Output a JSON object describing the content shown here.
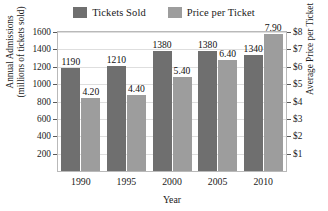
{
  "chart_data": {
    "type": "bar",
    "title": "",
    "xlabel": "Year",
    "categories": [
      "1990",
      "1995",
      "2000",
      "2005",
      "2010"
    ],
    "series": [
      {
        "name": "Tickets Sold",
        "axis": "left",
        "color": "#6f6f6f",
        "values": [
          1190,
          1210,
          1380,
          1380,
          1340
        ],
        "labels": [
          "1190",
          "1210",
          "1380",
          "1380",
          "1340"
        ]
      },
      {
        "name": "Price per Ticket",
        "axis": "right",
        "color": "#9d9d9d",
        "values": [
          4.2,
          4.4,
          5.4,
          6.4,
          7.9
        ],
        "labels": [
          "4.20",
          "4.40",
          "5.40",
          "6.40",
          "7.90"
        ]
      }
    ],
    "left_axis": {
      "title_line1": "Annual Admissions",
      "title_line2": "(millions of tickets sold)",
      "ylim": [
        0,
        1600
      ],
      "ticks": [
        1600,
        1400,
        1200,
        1000,
        800,
        600,
        400,
        200
      ],
      "ticklabels": [
        "1600",
        "1400",
        "1200",
        "1000",
        "800",
        "600",
        "400",
        "200"
      ]
    },
    "right_axis": {
      "title": "Average Price per Ticket",
      "ylim": [
        0,
        8
      ],
      "ticks": [
        8,
        7,
        6,
        5,
        4,
        3,
        2,
        1
      ],
      "ticklabels": [
        "$8",
        "$7",
        "$6",
        "$5",
        "$4",
        "$3",
        "$2",
        "$1"
      ]
    },
    "grid": true,
    "legend_position": "top-center"
  },
  "legend": {
    "entries": [
      {
        "label": "Tickets Sold",
        "color": "#6f6f6f"
      },
      {
        "label": "Price per Ticket",
        "color": "#9d9d9d"
      }
    ]
  }
}
